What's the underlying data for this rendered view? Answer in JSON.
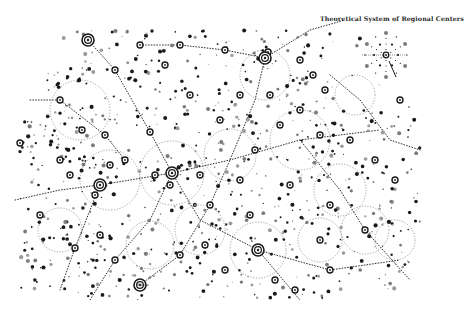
{
  "title": "Theoretical System of Regional Centers",
  "labels": [
    {
      "text": "Bayou",
      "x": 136,
      "y": 282
    }
  ],
  "colors": {
    "ink": "#1a1a1a",
    "gray": "#7a7a7a",
    "light": "#9a9a9a",
    "paper": "#ffffff"
  },
  "map": {
    "major_centers": [
      {
        "x": 172,
        "y": 173
      },
      {
        "x": 265,
        "y": 58
      },
      {
        "x": 100,
        "y": 185
      },
      {
        "x": 258,
        "y": 250
      },
      {
        "x": 140,
        "y": 285
      },
      {
        "x": 88,
        "y": 40
      }
    ],
    "regional_centers": [
      {
        "x": 115,
        "y": 70
      },
      {
        "x": 140,
        "y": 45
      },
      {
        "x": 180,
        "y": 45
      },
      {
        "x": 225,
        "y": 50
      },
      {
        "x": 268,
        "y": 52
      },
      {
        "x": 300,
        "y": 60
      },
      {
        "x": 313,
        "y": 75
      },
      {
        "x": 325,
        "y": 90
      },
      {
        "x": 60,
        "y": 160
      },
      {
        "x": 82,
        "y": 130
      },
      {
        "x": 70,
        "y": 175
      },
      {
        "x": 95,
        "y": 195
      },
      {
        "x": 105,
        "y": 135
      },
      {
        "x": 110,
        "y": 165
      },
      {
        "x": 125,
        "y": 160
      },
      {
        "x": 150,
        "y": 132
      },
      {
        "x": 155,
        "y": 175
      },
      {
        "x": 170,
        "y": 185
      },
      {
        "x": 200,
        "y": 175
      },
      {
        "x": 210,
        "y": 205
      },
      {
        "x": 250,
        "y": 215
      },
      {
        "x": 255,
        "y": 150
      },
      {
        "x": 270,
        "y": 95
      },
      {
        "x": 280,
        "y": 125
      },
      {
        "x": 300,
        "y": 110
      },
      {
        "x": 320,
        "y": 135
      },
      {
        "x": 350,
        "y": 140
      },
      {
        "x": 375,
        "y": 160
      },
      {
        "x": 395,
        "y": 180
      },
      {
        "x": 290,
        "y": 185
      },
      {
        "x": 330,
        "y": 205
      },
      {
        "x": 365,
        "y": 230
      },
      {
        "x": 320,
        "y": 240
      },
      {
        "x": 275,
        "y": 280
      },
      {
        "x": 225,
        "y": 270
      },
      {
        "x": 180,
        "y": 255
      },
      {
        "x": 115,
        "y": 260
      },
      {
        "x": 75,
        "y": 248
      },
      {
        "x": 40,
        "y": 215
      },
      {
        "x": 20,
        "y": 143
      },
      {
        "x": 400,
        "y": 100
      },
      {
        "x": 220,
        "y": 120
      },
      {
        "x": 190,
        "y": 95
      },
      {
        "x": 240,
        "y": 95
      },
      {
        "x": 165,
        "y": 65
      },
      {
        "x": 60,
        "y": 100
      },
      {
        "x": 100,
        "y": 235
      },
      {
        "x": 295,
        "y": 290
      },
      {
        "x": 330,
        "y": 270
      },
      {
        "x": 240,
        "y": 180
      },
      {
        "x": 205,
        "y": 245
      }
    ],
    "service_areas": [
      {
        "x": 172,
        "y": 173,
        "r": 32
      },
      {
        "x": 258,
        "y": 250,
        "r": 28
      },
      {
        "x": 320,
        "y": 240,
        "r": 22
      },
      {
        "x": 365,
        "y": 230,
        "r": 24
      },
      {
        "x": 395,
        "y": 240,
        "r": 20
      },
      {
        "x": 300,
        "y": 140,
        "r": 30
      },
      {
        "x": 230,
        "y": 155,
        "r": 26
      },
      {
        "x": 110,
        "y": 180,
        "r": 30
      },
      {
        "x": 265,
        "y": 75,
        "r": 25
      },
      {
        "x": 80,
        "y": 110,
        "r": 30
      },
      {
        "x": 60,
        "y": 230,
        "r": 22
      },
      {
        "x": 340,
        "y": 190,
        "r": 26
      },
      {
        "x": 200,
        "y": 230,
        "r": 25
      },
      {
        "x": 150,
        "y": 245,
        "r": 24
      },
      {
        "x": 355,
        "y": 95,
        "r": 20
      }
    ],
    "routes": [
      [
        {
          "x": 15,
          "y": 200
        },
        {
          "x": 60,
          "y": 190
        },
        {
          "x": 100,
          "y": 185
        },
        {
          "x": 172,
          "y": 173
        },
        {
          "x": 230,
          "y": 160
        },
        {
          "x": 300,
          "y": 140
        },
        {
          "x": 380,
          "y": 130
        }
      ],
      [
        {
          "x": 88,
          "y": 40
        },
        {
          "x": 115,
          "y": 70
        },
        {
          "x": 150,
          "y": 132
        },
        {
          "x": 172,
          "y": 173
        },
        {
          "x": 200,
          "y": 220
        },
        {
          "x": 258,
          "y": 250
        },
        {
          "x": 300,
          "y": 300
        }
      ],
      [
        {
          "x": 265,
          "y": 58
        },
        {
          "x": 255,
          "y": 100
        },
        {
          "x": 230,
          "y": 160
        },
        {
          "x": 210,
          "y": 205
        },
        {
          "x": 180,
          "y": 255
        },
        {
          "x": 140,
          "y": 285
        }
      ],
      [
        {
          "x": 30,
          "y": 100
        },
        {
          "x": 60,
          "y": 100
        },
        {
          "x": 105,
          "y": 135
        },
        {
          "x": 125,
          "y": 160
        }
      ],
      [
        {
          "x": 265,
          "y": 58
        },
        {
          "x": 310,
          "y": 30
        },
        {
          "x": 345,
          "y": 20
        }
      ],
      [
        {
          "x": 100,
          "y": 185
        },
        {
          "x": 75,
          "y": 248
        },
        {
          "x": 60,
          "y": 290
        }
      ],
      [
        {
          "x": 258,
          "y": 250
        },
        {
          "x": 330,
          "y": 270
        },
        {
          "x": 400,
          "y": 260
        }
      ],
      [
        {
          "x": 172,
          "y": 173
        },
        {
          "x": 150,
          "y": 220
        },
        {
          "x": 115,
          "y": 260
        },
        {
          "x": 90,
          "y": 300
        }
      ],
      [
        {
          "x": 300,
          "y": 140
        },
        {
          "x": 340,
          "y": 190
        },
        {
          "x": 365,
          "y": 230
        },
        {
          "x": 410,
          "y": 280
        }
      ],
      [
        {
          "x": 140,
          "y": 45
        },
        {
          "x": 180,
          "y": 45
        },
        {
          "x": 225,
          "y": 50
        },
        {
          "x": 265,
          "y": 58
        }
      ],
      [
        {
          "x": 330,
          "y": 75
        },
        {
          "x": 360,
          "y": 100
        },
        {
          "x": 390,
          "y": 140
        },
        {
          "x": 420,
          "y": 150
        }
      ]
    ],
    "dot_field": {
      "count": 900,
      "bbox": [
        20,
        30,
        420,
        300
      ],
      "seed": 7
    }
  },
  "inset": {
    "center": {
      "x": 386,
      "y": 55
    },
    "ring1_r": 12,
    "ring2_r": 22,
    "ring1_count": 6,
    "ring2_count": 6
  }
}
